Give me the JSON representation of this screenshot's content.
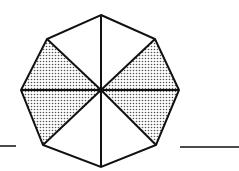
{
  "diagram": {
    "type": "octagon-divided-into-triangles",
    "center": [
      101,
      90
    ],
    "vertices": {
      "top": [
        101,
        15
      ],
      "upper_right": [
        155,
        39
      ],
      "right": [
        179,
        90
      ],
      "lower_right": [
        156,
        145
      ],
      "bottom": [
        101,
        167
      ],
      "lower_left": [
        43,
        145
      ],
      "left": [
        21,
        90
      ],
      "upper_left": [
        47,
        39
      ]
    },
    "triangles": [
      {
        "name": "top-left",
        "shaded": false
      },
      {
        "name": "top-right",
        "shaded": false
      },
      {
        "name": "upper-right",
        "shaded": true
      },
      {
        "name": "lower-right",
        "shaded": true
      },
      {
        "name": "bottom-right",
        "shaded": false
      },
      {
        "name": "bottom-left",
        "shaded": false
      },
      {
        "name": "lower-left",
        "shaded": true
      },
      {
        "name": "upper-left",
        "shaded": true
      }
    ],
    "shaded_count": 4,
    "total_count": 8,
    "answer_blanks": 2,
    "colors": {
      "stroke": "#111111",
      "shade_dot": "#555555",
      "background": "#ffffff"
    }
  }
}
